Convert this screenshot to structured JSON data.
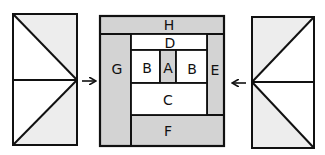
{
  "diagram": {
    "colors": {
      "dark_fill": "#d3d3d3",
      "light_fill": "#ededed",
      "white": "#ffffff",
      "stroke": "#111111"
    },
    "center_block": {
      "labels": {
        "H": "H",
        "G": "G",
        "E": "E",
        "F": "F",
        "D": "D",
        "B_left": "B",
        "A": "A",
        "B_right": "B",
        "C": "C"
      },
      "shaded_pieces": [
        "H",
        "G",
        "E",
        "F",
        "A"
      ],
      "white_pieces": [
        "D",
        "B",
        "B",
        "C"
      ]
    },
    "left_unit": {
      "description": "rectangle split horizontally with two diagonals meeting at right-middle point",
      "arrow_direction": "right"
    },
    "right_unit": {
      "description": "rectangle split horizontally with two diagonals meeting at left-middle point",
      "arrow_direction": "left"
    }
  }
}
